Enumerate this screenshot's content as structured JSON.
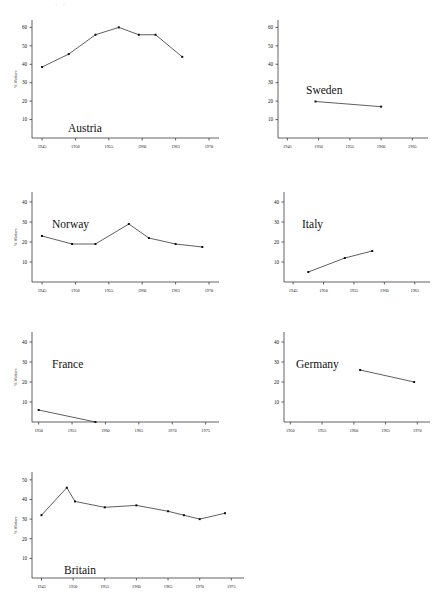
{
  "page": {
    "top_artifact_text": "· ·",
    "axis_color": "#3b3b3b",
    "line_color": "#2a2a2a",
    "background": "#ffffff"
  },
  "chart_data": [
    {
      "id": "austria",
      "type": "line",
      "title": "Austria",
      "xlabel": "",
      "ylabel": "% Workers",
      "xlim": [
        1943.5,
        1971.5
      ],
      "ylim": [
        0,
        64
      ],
      "xticks": [
        1945,
        1950,
        1955,
        1960,
        1965,
        1970
      ],
      "xticklabels": [
        "1945",
        "1950",
        "1955",
        "1960",
        "1965",
        "1970"
      ],
      "yticks": [
        10,
        20,
        30,
        40,
        50,
        60
      ],
      "yticklabels": [
        "10",
        "20",
        "30",
        "40",
        "50",
        "60"
      ],
      "grid": false,
      "legend": "none",
      "x": [
        1945,
        1949,
        1953,
        1956.5,
        1959.5,
        1962,
        1966
      ],
      "values": [
        38.5,
        45.5,
        56.0,
        60.0,
        56.0,
        56.0,
        44.0
      ]
    },
    {
      "id": "sweden",
      "type": "line",
      "title": "Sweden",
      "xlabel": "",
      "ylabel": "",
      "xlim": [
        1943.5,
        1967.5
      ],
      "ylim": [
        0,
        64
      ],
      "xticks": [
        1945,
        1950,
        1955,
        1960,
        1965
      ],
      "xticklabels": [
        "1945",
        "1950",
        "1955",
        "1960",
        "1965"
      ],
      "yticks": [
        10,
        20,
        30,
        40,
        50,
        60
      ],
      "yticklabels": [
        "10",
        "20",
        "30",
        "40",
        "50",
        "60"
      ],
      "grid": false,
      "legend": "none",
      "x": [
        1949.5,
        1960
      ],
      "values": [
        19.8,
        17.0
      ]
    },
    {
      "id": "norway",
      "type": "line",
      "title": "Norway",
      "xlabel": "",
      "ylabel": "% Workers",
      "xlim": [
        1943.5,
        1971.5
      ],
      "ylim": [
        0,
        45
      ],
      "xticks": [
        1945,
        1950,
        1955,
        1960,
        1965,
        1970
      ],
      "xticklabels": [
        "1945",
        "1950",
        "1955",
        "1960",
        "1965",
        "1970"
      ],
      "yticks": [
        10,
        20,
        30,
        40
      ],
      "yticklabels": [
        "10",
        "20",
        "30",
        "40"
      ],
      "grid": false,
      "legend": "none",
      "x": [
        1945,
        1949.5,
        1953,
        1958,
        1961,
        1965,
        1969
      ],
      "values": [
        23.0,
        19.0,
        19.0,
        29.0,
        22.0,
        19.0,
        17.5
      ]
    },
    {
      "id": "italy",
      "type": "line",
      "title": "Italy",
      "xlabel": "",
      "ylabel": "",
      "xlim": [
        1943.5,
        1967.5
      ],
      "ylim": [
        0,
        45
      ],
      "xticks": [
        1945,
        1950,
        1955,
        1960,
        1965
      ],
      "xticklabels": [
        "1945",
        "1950",
        "1955",
        "1960",
        "1965"
      ],
      "yticks": [
        10,
        20,
        30,
        40
      ],
      "yticklabels": [
        "10",
        "20",
        "30",
        "40"
      ],
      "grid": false,
      "legend": "none",
      "x": [
        1947.5,
        1953.5,
        1958
      ],
      "values": [
        5.0,
        12.0,
        15.5
      ]
    },
    {
      "id": "france",
      "type": "line",
      "title": "France",
      "xlabel": "",
      "ylabel": "% Workers",
      "xlim": [
        1949,
        1977
      ],
      "ylim": [
        0,
        45
      ],
      "xticks": [
        1950,
        1955,
        1960,
        1965,
        1970,
        1975
      ],
      "xticklabels": [
        "1950",
        "1955",
        "1960",
        "1965",
        "1970",
        "1975"
      ],
      "yticks": [
        10,
        20,
        30,
        40
      ],
      "yticklabels": [
        "10",
        "20",
        "30",
        "40"
      ],
      "grid": false,
      "legend": "none",
      "x": [
        1950,
        1958.5
      ],
      "values": [
        6.0,
        0.0
      ]
    },
    {
      "id": "germany",
      "type": "line",
      "title": "Germany",
      "xlabel": "",
      "ylabel": "",
      "xlim": [
        1949,
        1972
      ],
      "ylim": [
        0,
        45
      ],
      "xticks": [
        1950,
        1955,
        1960,
        1965,
        1970
      ],
      "xticklabels": [
        "1950",
        "1955",
        "1960",
        "1965",
        "1970"
      ],
      "yticks": [
        10,
        20,
        30,
        40
      ],
      "yticklabels": [
        "10",
        "20",
        "30",
        "40"
      ],
      "grid": false,
      "legend": "none",
      "x": [
        1961,
        1969.5
      ],
      "values": [
        26.0,
        20.0
      ]
    },
    {
      "id": "britain",
      "type": "line",
      "title": "Britain",
      "xlabel": "",
      "ylabel": "% Workers",
      "xlim": [
        1943.5,
        1977
      ],
      "ylim": [
        0,
        54
      ],
      "xticks": [
        1945,
        1950,
        1955,
        1960,
        1965,
        1970,
        1975
      ],
      "xticklabels": [
        "1945",
        "1950",
        "1955",
        "1960",
        "1965",
        "1970",
        "1975"
      ],
      "yticks": [
        10,
        20,
        30,
        40,
        50
      ],
      "yticklabels": [
        "10",
        "20",
        "30",
        "40",
        "50"
      ],
      "grid": false,
      "legend": "none",
      "x": [
        1945,
        1949,
        1950.3,
        1955,
        1960,
        1965,
        1967.5,
        1970,
        1974
      ],
      "values": [
        32.0,
        46.0,
        39.0,
        36.0,
        37.0,
        34.0,
        32.0,
        30.0,
        33.0
      ]
    }
  ]
}
